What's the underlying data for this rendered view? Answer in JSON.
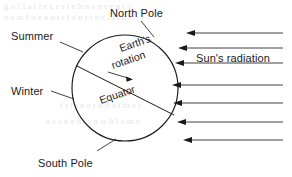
{
  "diagram": {
    "background_color": "#ffffff",
    "line_color": "#1a1a1a",
    "labels": {
      "north_pole": "North Pole",
      "south_pole": "South Pole",
      "summer": "Summer",
      "winter": "Winter",
      "equator": "Equator",
      "earths_rotation_line1": "Earth's",
      "earths_rotation_line2": "rotation",
      "suns_radiation": "Sun's radiation"
    },
    "globe": {
      "center_x": 125,
      "center_y": 88,
      "radius": 53
    },
    "radiation_arrows": {
      "count": 7,
      "direction": "right-to-left",
      "y_positions": [
        33,
        48,
        63,
        85,
        103,
        122,
        140
      ],
      "x_start": 283,
      "x_end_values": [
        186,
        178,
        175,
        172,
        173,
        177,
        183
      ]
    },
    "ghost_text": {
      "line1": "g o f l a l l e c r s t e h n a n r e n t o",
      "line2": "n s  m  f o e  a o t  r t e  n r  i n  c l i  t h e",
      "line3": "f  r t i  n e r  a d  o t  m e t",
      "line4": "a s  s n  e n t  r  o w  h  l a  m e"
    }
  }
}
